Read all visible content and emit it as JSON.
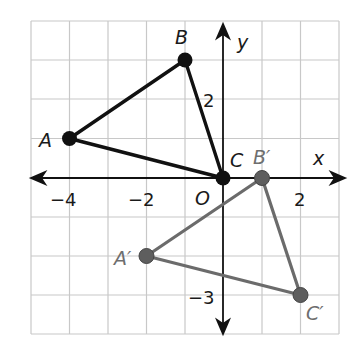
{
  "diagram": {
    "type": "coordinate-plane-transformation",
    "grid": {
      "x_min": -5,
      "x_max": 3,
      "y_min": -4,
      "y_max": 4,
      "step": 1
    },
    "axes": {
      "x_label": "x",
      "y_label": "y",
      "origin_label": "O"
    },
    "ticks": {
      "x": [
        {
          "value": -4,
          "label": "−4"
        },
        {
          "value": -2,
          "label": "−2"
        },
        {
          "value": 2,
          "label": "2"
        }
      ],
      "y": [
        {
          "value": 2,
          "label": "2"
        },
        {
          "value": -3,
          "label": "−3"
        }
      ]
    },
    "original_triangle": {
      "color": "#111111",
      "vertices": [
        {
          "name": "A",
          "label": "A",
          "x": -4,
          "y": 1
        },
        {
          "name": "B",
          "label": "B",
          "x": -1,
          "y": 3
        },
        {
          "name": "C",
          "label": "C",
          "x": 0,
          "y": 0
        }
      ]
    },
    "image_triangle": {
      "color": "#6b6b6b",
      "vertices": [
        {
          "name": "A'",
          "label": "A′",
          "x": -2,
          "y": -2
        },
        {
          "name": "B'",
          "label": "B′",
          "x": 1,
          "y": 0
        },
        {
          "name": "C'",
          "label": "C′",
          "x": 2,
          "y": -3
        }
      ]
    },
    "colors": {
      "grid": "#c8c8c8",
      "axis": "#111111"
    }
  }
}
